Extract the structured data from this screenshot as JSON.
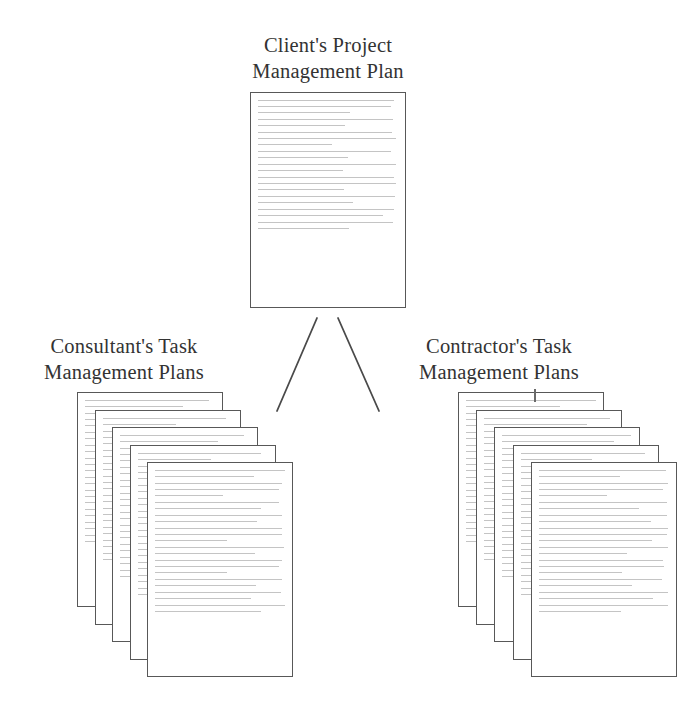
{
  "figure": {
    "type": "hierarchy-diagram",
    "background_color": "#ffffff",
    "document_border_color": "#585858",
    "document_fill_color": "#ffffff",
    "text_line_color": "#c4c4c4",
    "connector_color": "#4a4a4a",
    "label_color": "#333333"
  },
  "nodes": {
    "root": {
      "label": "Client's Project\nManagement Plan",
      "count": 1,
      "doc": {
        "x": 250,
        "y": 92,
        "width": 156,
        "height": 216
      }
    },
    "left_branch": {
      "label": "Consultant's Task\nManagement Plans",
      "count": 5,
      "doc": {
        "x": 77,
        "y": 392,
        "width": 146,
        "height": 215
      },
      "offset_x": 17.5,
      "offset_y": 17.5
    },
    "right_branch": {
      "label": "Contractor's Task\nManagement Plans",
      "count": 5,
      "doc": {
        "x": 458,
        "y": 392,
        "width": 146,
        "height": 215
      },
      "offset_x": 18.2,
      "offset_y": 17.5
    }
  },
  "connectors": [
    {
      "name": "root-to-consultant",
      "x1": 317,
      "y1": 318,
      "x2": 277,
      "y2": 411
    },
    {
      "name": "root-to-contractor",
      "x1": 338,
      "y1": 318,
      "x2": 379,
      "y2": 411
    }
  ],
  "artifacts": [
    {
      "name": "stray-tick",
      "x": 534,
      "y": 389,
      "height": 13
    }
  ],
  "paragraph_layout": {
    "root": [
      3,
      2,
      3,
      2,
      2,
      3,
      2,
      2,
      2
    ],
    "branch": [
      2,
      3,
      2,
      2,
      3,
      2,
      3,
      2,
      2,
      2
    ]
  }
}
